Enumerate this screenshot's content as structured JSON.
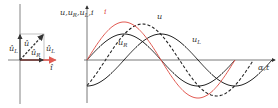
{
  "colors": {
    "axis": "#555555",
    "curve": "#222222",
    "current": "#e25a52",
    "phasor_box": "#9a9a9a"
  },
  "phasor_diagram": {
    "labels": {
      "u_hat_L_left": "û",
      "u_hat_L_left_sub": "L",
      "u_hat": "û",
      "u_hat_R": "û",
      "u_hat_R_sub": "R",
      "u_hat_L_right": "û",
      "u_hat_L_right_sub": "L",
      "i_hat": "î"
    }
  },
  "wave_diagram": {
    "y_axis_label": "u,u",
    "y_axis_label_sub1": "R",
    "y_axis_label_mid": ",u",
    "y_axis_label_sub2": "L",
    "y_axis_label_end": ",i",
    "x_axis_label": "α,t",
    "curve_labels": {
      "i": "i",
      "u": "u",
      "u_R": "u",
      "u_R_sub": "R",
      "u_L": "u",
      "u_L_sub": "L"
    }
  },
  "chart_data": {
    "type": "line",
    "title": "",
    "xlabel": "α,t",
    "ylabel": "u, u_R, u_L, i",
    "series": [
      {
        "name": "i",
        "style": "solid-red",
        "amplitude": 38,
        "phase_deg": 0
      },
      {
        "name": "u_R",
        "style": "solid-black",
        "amplitude": 26,
        "phase_deg": 0
      },
      {
        "name": "u",
        "style": "dashed-black",
        "amplitude": 36,
        "phase_deg": 45
      },
      {
        "name": "u_L",
        "style": "solid-black",
        "amplitude": 26,
        "phase_deg": 90
      }
    ],
    "period_px": 148,
    "origin_px": [
      87,
      60
    ]
  }
}
